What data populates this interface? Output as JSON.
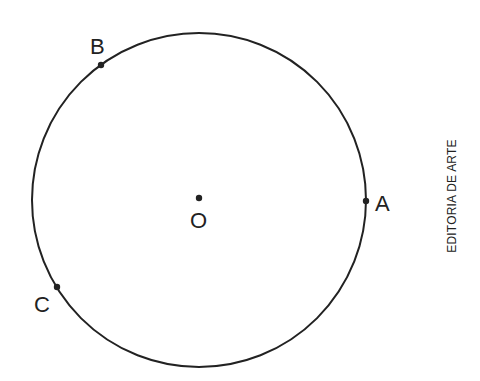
{
  "diagram": {
    "type": "circle-with-points",
    "center": {
      "label": "O"
    },
    "points": [
      {
        "label": "A",
        "position": "right"
      },
      {
        "label": "B",
        "position": "upper-left"
      },
      {
        "label": "C",
        "position": "lower-left"
      }
    ]
  },
  "credit": "EDITORIA DE ARTE"
}
